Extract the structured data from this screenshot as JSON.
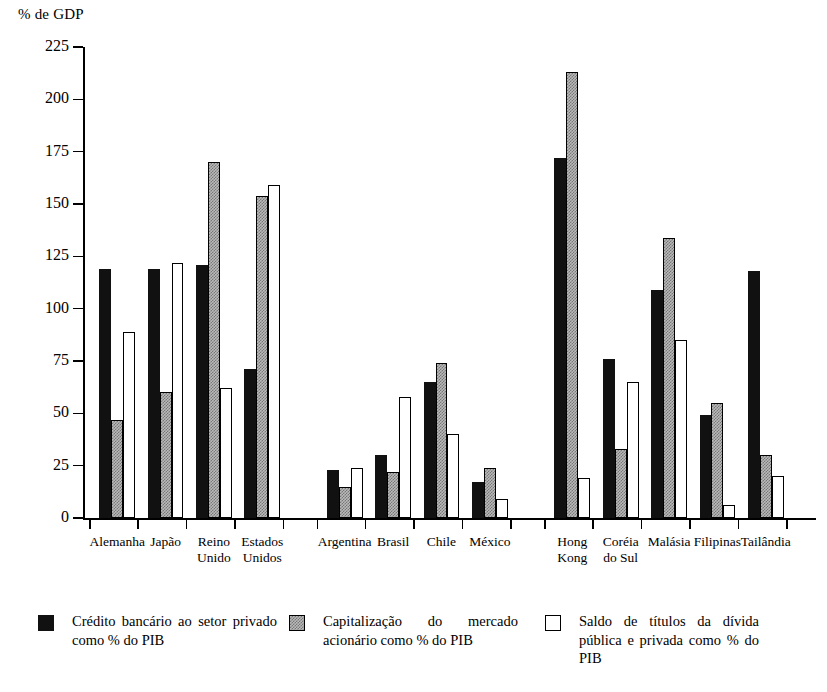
{
  "chart_data": {
    "type": "bar",
    "title": "% de GDP",
    "ylabel": "% de GDP",
    "xlabel": "",
    "ylim": [
      0,
      225
    ],
    "yticks": [
      0,
      25,
      50,
      75,
      100,
      125,
      150,
      175,
      200,
      225
    ],
    "grid": false,
    "legend_position": "bottom",
    "categories": [
      "Alemanha",
      "Japão",
      "Reino\nUnido",
      "Estados\nUnidos",
      "Argentina",
      "Brasil",
      "Chile",
      "México",
      "Hong\nKong",
      "Coréia\ndo Sul",
      "Malásia",
      "Filipinas",
      "Tailândia"
    ],
    "groups": [
      {
        "name": "group-1",
        "categories": [
          "Alemanha",
          "Japão",
          "Reino\nUnido",
          "Estados\nUnidos"
        ]
      },
      {
        "name": "group-2",
        "categories": [
          "Argentina",
          "Brasil",
          "Chile",
          "México"
        ]
      },
      {
        "name": "group-3",
        "categories": [
          "Hong\nKong",
          "Coréia\ndo Sul",
          "Malásia",
          "Filipinas",
          "Tailândia"
        ]
      }
    ],
    "series": [
      {
        "name": "Crédito bancário ao setor privado como % do PIB",
        "fill": "black",
        "values": [
          119,
          119,
          121,
          71,
          23,
          30,
          65,
          17,
          172,
          76,
          109,
          49,
          118
        ]
      },
      {
        "name": "Capitalização do mercado acionário como % do PIB",
        "fill": "gray",
        "values": [
          47,
          60,
          170,
          154,
          15,
          22,
          74,
          24,
          213,
          33,
          134,
          55,
          30
        ]
      },
      {
        "name": "Saldo de títulos da dívida pública e privada como % do PIB",
        "fill": "white",
        "values": [
          89,
          122,
          62,
          159,
          24,
          58,
          40,
          9,
          19,
          65,
          85,
          6,
          20
        ]
      }
    ]
  },
  "legend": {
    "items": [
      {
        "swatch": "black",
        "label": "Crédito bancário ao setor privado como % do PIB"
      },
      {
        "swatch": "gray",
        "label": "Capitalização do mercado acionário como % do PIB"
      },
      {
        "swatch": "white",
        "label": "Saldo de títulos da dívida pública e privada como % do PIB"
      }
    ]
  },
  "colors": {
    "series_black": "#111111",
    "series_gray": "#b9b9b9",
    "series_white": "#ffffff",
    "axis": "#000000",
    "background": "#ffffff"
  }
}
